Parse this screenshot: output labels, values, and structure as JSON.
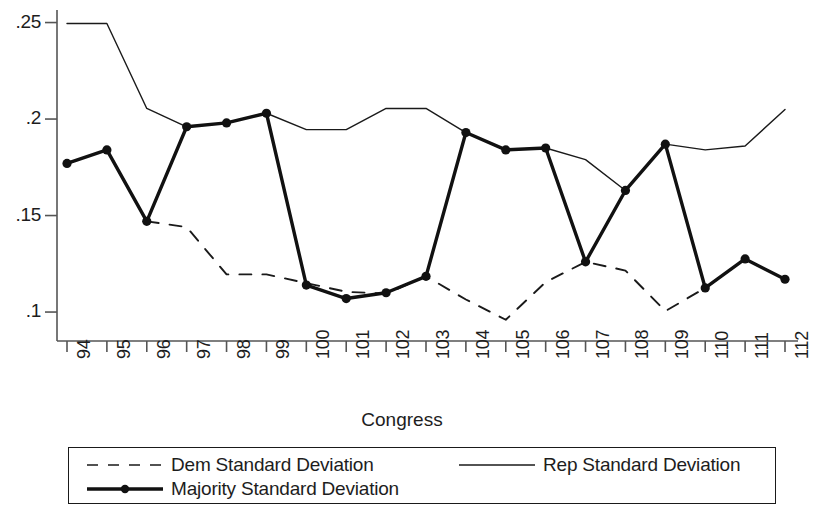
{
  "chart_data": {
    "type": "line",
    "title": "",
    "xlabel": "Congress",
    "ylabel": "",
    "categories": [
      "94",
      "95",
      "96",
      "97",
      "98",
      "99",
      "100",
      "101",
      "102",
      "103",
      "104",
      "105",
      "106",
      "107",
      "108",
      "109",
      "110",
      "111",
      "112"
    ],
    "xlim": [
      94,
      112
    ],
    "ylim": [
      0.085,
      0.2565
    ],
    "yticks": [
      ".1",
      ".15",
      ".2",
      ".25"
    ],
    "ytick_values": [
      0.1,
      0.15,
      0.2,
      0.25
    ],
    "grid": false,
    "legend_position": "below-plot",
    "series": [
      {
        "name": "Dem Standard Deviation",
        "style": "dashed",
        "marker": "none",
        "color": "#1a1a1a",
        "x": [
          96,
          97,
          98,
          99,
          100,
          101,
          102,
          103,
          104,
          105,
          106,
          107,
          108,
          109,
          110,
          111,
          112
        ],
        "values": [
          0.147,
          0.144,
          0.1195,
          0.1195,
          0.115,
          0.1105,
          0.1095,
          0.1185,
          0.1065,
          0.096,
          0.1155,
          0.126,
          0.1215,
          0.1005,
          0.1125,
          0.1275,
          0.117
        ]
      },
      {
        "name": "Rep Standard Deviation",
        "style": "solid-thin",
        "marker": "none",
        "color": "#1a1a1a",
        "x": [
          94,
          95,
          96,
          97,
          98,
          99,
          100,
          101,
          102,
          103,
          104,
          105,
          106,
          107,
          108,
          109,
          110,
          111,
          112
        ],
        "values": [
          0.2495,
          0.2495,
          0.2055,
          0.196,
          0.198,
          0.203,
          0.1945,
          0.1945,
          0.2055,
          0.2055,
          0.193,
          0.184,
          0.185,
          0.179,
          0.163,
          0.187,
          0.184,
          0.186,
          0.205
        ]
      },
      {
        "name": "Majority Standard Deviation",
        "style": "solid-thick",
        "marker": "circle",
        "color": "#111111",
        "x": [
          94,
          95,
          96,
          97,
          98,
          99,
          100,
          101,
          102,
          103,
          104,
          105,
          106,
          107,
          108,
          109,
          110,
          111,
          112
        ],
        "values": [
          0.177,
          0.184,
          0.147,
          0.196,
          0.198,
          0.203,
          0.114,
          0.107,
          0.11,
          0.1185,
          0.193,
          0.184,
          0.185,
          0.126,
          0.163,
          0.187,
          0.1125,
          0.1275,
          0.117
        ]
      }
    ]
  },
  "axis": {
    "x_title": "Congress"
  },
  "legend": {
    "entries": [
      {
        "label": "Dem Standard Deviation"
      },
      {
        "label": "Rep Standard Deviation"
      },
      {
        "label": "Majority Standard Deviation"
      }
    ]
  }
}
